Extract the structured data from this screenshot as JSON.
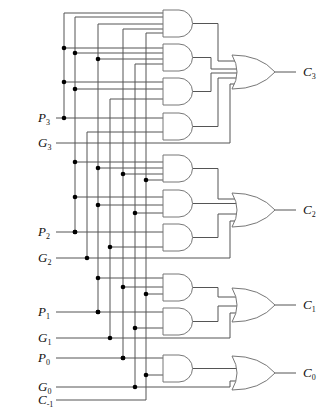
{
  "diagram": {
    "inputs": [
      {
        "id": "P3",
        "label": "P",
        "sub": "3"
      },
      {
        "id": "G3",
        "label": "G",
        "sub": "3"
      },
      {
        "id": "P2",
        "label": "P",
        "sub": "2"
      },
      {
        "id": "G2",
        "label": "G",
        "sub": "2"
      },
      {
        "id": "P1",
        "label": "P",
        "sub": "1"
      },
      {
        "id": "G1",
        "label": "G",
        "sub": "1"
      },
      {
        "id": "P0",
        "label": "P",
        "sub": "0"
      },
      {
        "id": "G0",
        "label": "G",
        "sub": "0"
      },
      {
        "id": "Cm1",
        "label": "C",
        "sub": "-1"
      }
    ],
    "outputs": [
      {
        "id": "C3",
        "label": "C",
        "sub": "3"
      },
      {
        "id": "C2",
        "label": "C",
        "sub": "2"
      },
      {
        "id": "C1",
        "label": "C",
        "sub": "1"
      },
      {
        "id": "C0",
        "label": "C",
        "sub": "0"
      }
    ],
    "gates": {
      "and_count": 10,
      "or_count": 4,
      "and_gates": [
        {
          "name": "and-P3P2P1P0C-1",
          "inputs": [
            "P3",
            "P2",
            "P1",
            "P0",
            "C-1"
          ],
          "feeds": "C3"
        },
        {
          "name": "and-P3P2P1G0",
          "inputs": [
            "P3",
            "P2",
            "P1",
            "G0"
          ],
          "feeds": "C3"
        },
        {
          "name": "and-P3P2G1",
          "inputs": [
            "P3",
            "P2",
            "G1"
          ],
          "feeds": "C3"
        },
        {
          "name": "and-P3G2",
          "inputs": [
            "P3",
            "G2"
          ],
          "feeds": "C3"
        },
        {
          "name": "and-P2P1P0C-1",
          "inputs": [
            "P2",
            "P1",
            "P0",
            "C-1"
          ],
          "feeds": "C2"
        },
        {
          "name": "and-P2P1G0",
          "inputs": [
            "P2",
            "P1",
            "G0"
          ],
          "feeds": "C2"
        },
        {
          "name": "and-P2G1",
          "inputs": [
            "P2",
            "G1"
          ],
          "feeds": "C2"
        },
        {
          "name": "and-P1P0C-1",
          "inputs": [
            "P1",
            "P0",
            "C-1"
          ],
          "feeds": "C1"
        },
        {
          "name": "and-P1G0",
          "inputs": [
            "P1",
            "G0"
          ],
          "feeds": "C1"
        },
        {
          "name": "and-P0C-1",
          "inputs": [
            "P0",
            "C-1"
          ],
          "feeds": "C0"
        }
      ]
    }
  }
}
